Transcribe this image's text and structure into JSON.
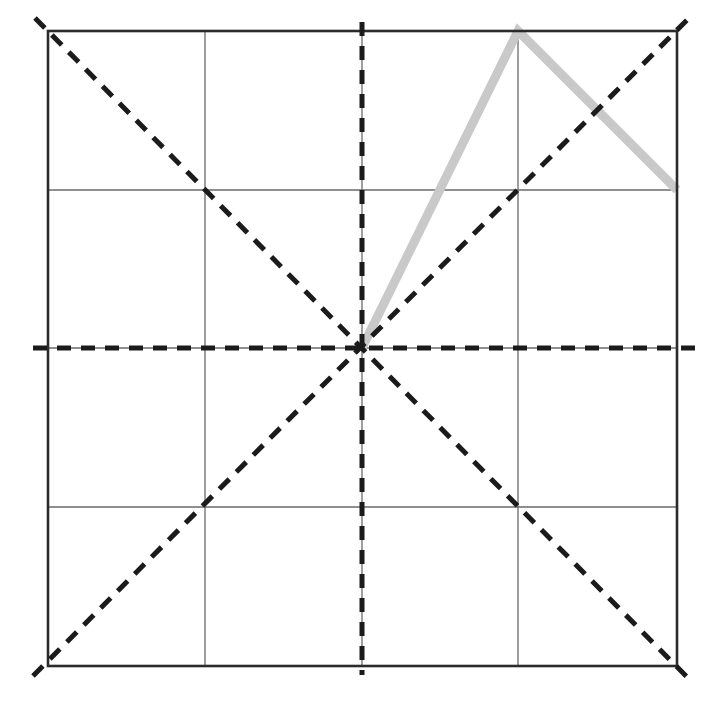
{
  "canvas": {
    "width": 719,
    "height": 707,
    "background": "#ffffff"
  },
  "colors": {
    "border": "#2b2b2b",
    "grid": "#6a6a6a",
    "fold": "#1b1b1b",
    "highlight": "#c9c9c9"
  },
  "square": {
    "left": 48,
    "top": 31,
    "right": 677,
    "bottom": 666
  },
  "grid_lines": {
    "vertical_x": [
      205,
      362,
      518
    ],
    "horizontal_y": [
      190,
      348,
      507
    ]
  },
  "grid_style": {
    "stroke_width": 1.3
  },
  "border_style": {
    "stroke_width": 2.6
  },
  "fold_lines": [
    {
      "name": "vertical-center-fold-line",
      "x1": 362,
      "y1": 22,
      "x2": 362,
      "y2": 675
    },
    {
      "name": "horizontal-center-fold-line",
      "x1": 33,
      "y1": 348,
      "x2": 699,
      "y2": 348
    },
    {
      "name": "diagonal-fold-line-tl-br",
      "x1": 35,
      "y1": 18,
      "x2": 688,
      "y2": 678
    },
    {
      "name": "diagonal-fold-line-bl-tr",
      "x1": 33,
      "y1": 676,
      "x2": 688,
      "y2": 19
    }
  ],
  "fold_style": {
    "stroke_width": 5,
    "dash": "14 10"
  },
  "highlight_path": {
    "points": [
      [
        362,
        348
      ],
      [
        518,
        31
      ],
      [
        677,
        190
      ]
    ],
    "stroke_width": 9
  }
}
